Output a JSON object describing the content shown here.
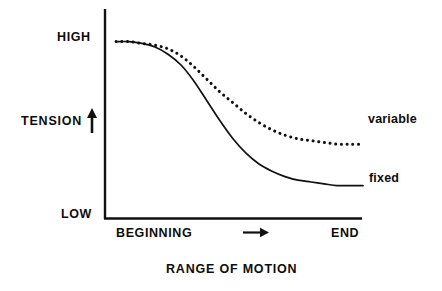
{
  "figure": {
    "title": "",
    "background_color": "#ffffff",
    "ink_color": "#111111"
  },
  "axes": {
    "y_axis_name": "TENSION",
    "y_axis_direction_icon": "up-arrow-icon",
    "y_tick_labels": [
      "HIGH",
      "LOW"
    ],
    "y_high_label": "HIGH",
    "y_low_label": "LOW",
    "x_tick_labels": [
      "BEGINNING",
      "END"
    ],
    "x_begin_label": "BEGINNING",
    "x_end_label": "END",
    "x_axis_title": "RANGE OF MOTION",
    "x_direction_icon": "right-arrow-icon"
  },
  "legend": {
    "variable_label": "variable",
    "fixed_label": "fixed"
  },
  "chart_data": {
    "type": "line",
    "title": "",
    "subtitle": "",
    "xlabel": "RANGE OF MOTION",
    "ylabel": "TENSION",
    "xlim": [
      0,
      100
    ],
    "ylim": [
      0,
      100
    ],
    "x_tick_labels": [
      "BEGINNING",
      "END"
    ],
    "x_tick_values": [
      5,
      100
    ],
    "y_tick_labels": [
      "LOW",
      "HIGH"
    ],
    "y_tick_values": [
      0,
      100
    ],
    "grid": false,
    "legend_position": "right-inline-end-of-line",
    "annotations": [
      {
        "text": "RANGE OF MOTION",
        "role": "x-axis-title"
      },
      {
        "text": "TENSION",
        "role": "y-axis-title"
      },
      {
        "text": "right-arrow-icon",
        "role": "x-direction-arrow"
      },
      {
        "text": "up-arrow-icon",
        "role": "y-direction-arrow"
      }
    ],
    "x": [
      5,
      10,
      15,
      20,
      25,
      30,
      35,
      40,
      45,
      50,
      55,
      60,
      65,
      70,
      75,
      80,
      85,
      90,
      95,
      100
    ],
    "series": [
      {
        "name": "variable",
        "style": "dotted",
        "color": "#111111",
        "values": [
          98,
          98,
          97,
          96,
          94,
          90,
          84,
          77,
          70,
          64,
          58,
          53,
          49,
          46,
          44,
          43,
          42,
          41,
          41,
          41
        ]
      },
      {
        "name": "fixed",
        "style": "solid",
        "color": "#111111",
        "values": [
          98,
          98,
          97,
          95,
          91,
          85,
          76,
          65,
          54,
          44,
          36,
          30,
          26,
          23,
          21,
          20,
          19,
          18,
          18,
          18
        ]
      }
    ]
  }
}
